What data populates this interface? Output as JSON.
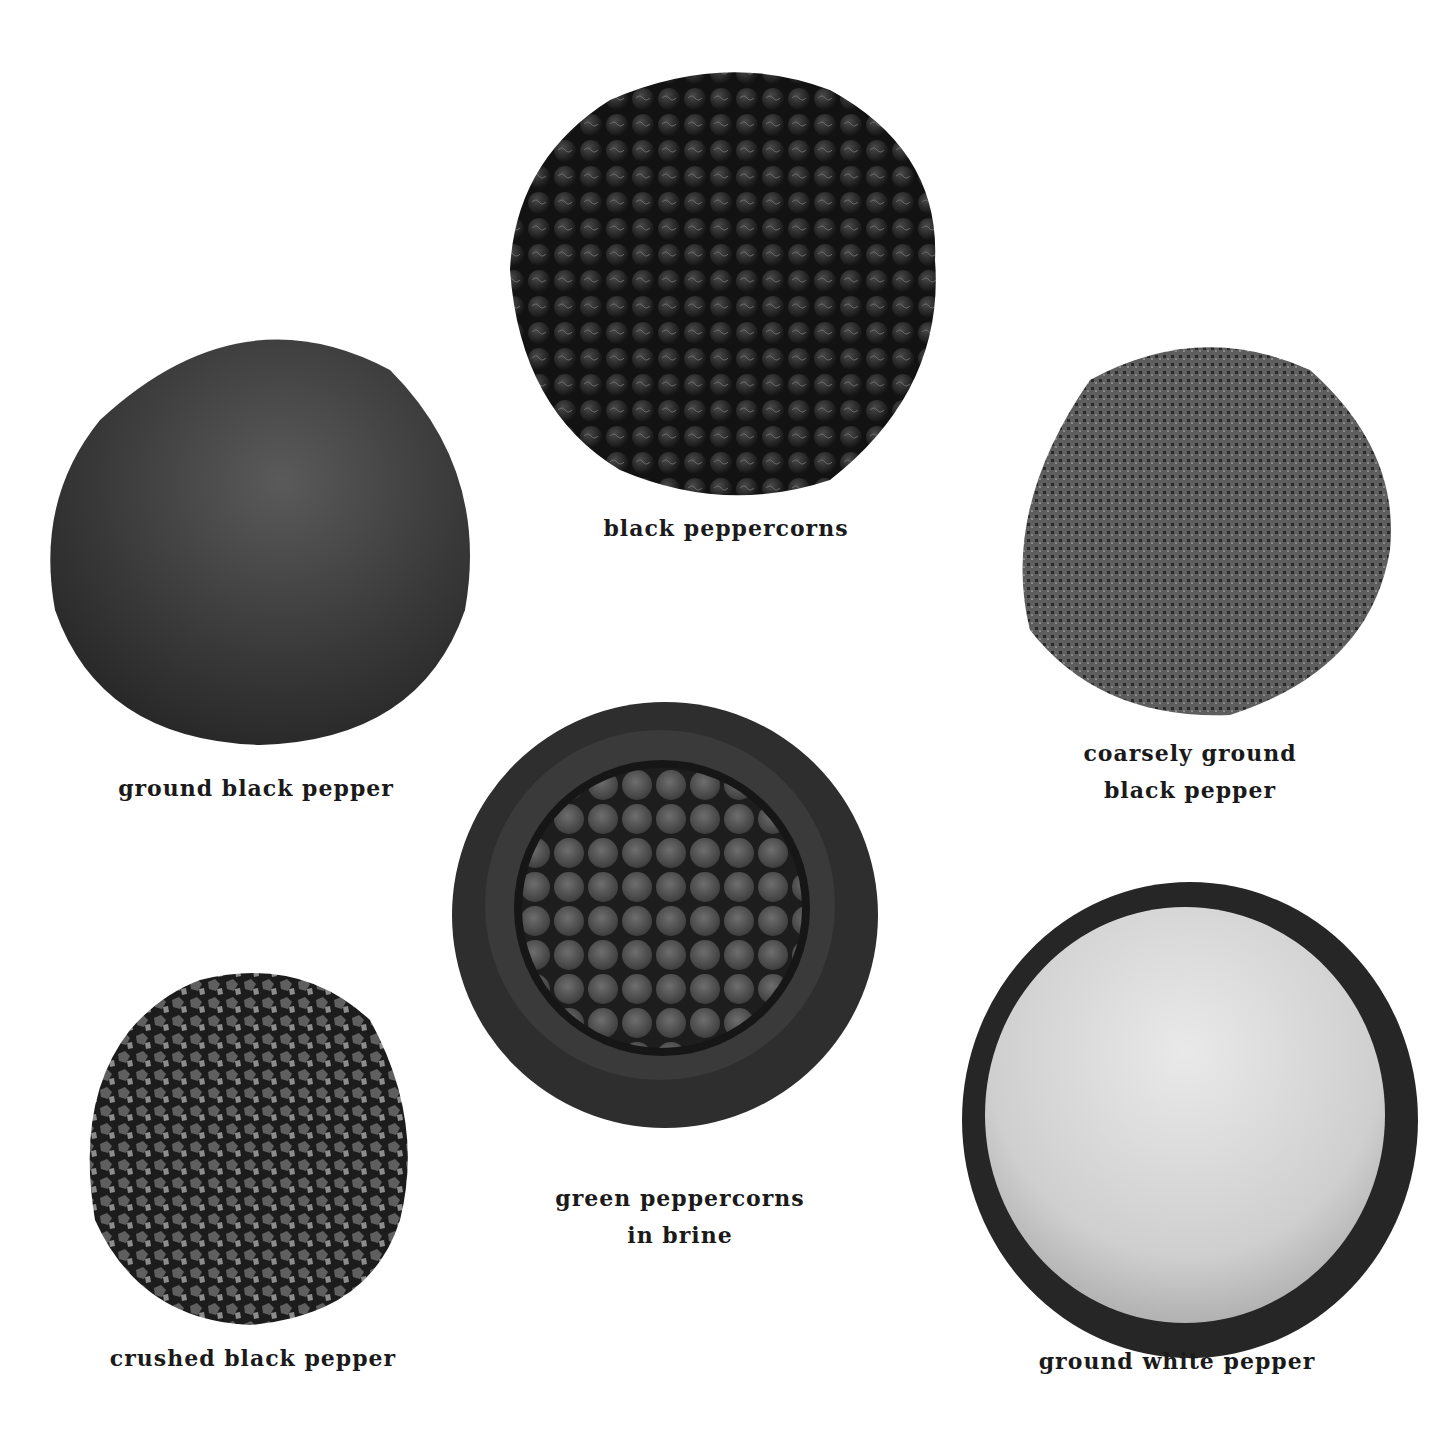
{
  "page": {
    "background": "#ffffff"
  },
  "items": [
    {
      "id": "black-peppercorns",
      "label_line1": "black peppercorns",
      "label_line2": ""
    },
    {
      "id": "coarsely-ground",
      "label_line1": "coarsely ground",
      "label_line2": "black pepper"
    },
    {
      "id": "ground-black",
      "label_line1": "ground black pepper",
      "label_line2": ""
    },
    {
      "id": "green-peppercorns",
      "label_line1": "green peppercorns",
      "label_line2": "in brine"
    },
    {
      "id": "crushed-black",
      "label_line1": "crushed black pepper",
      "label_line2": ""
    },
    {
      "id": "ground-white",
      "label_line1": "ground white pepper",
      "label_line2": ""
    }
  ],
  "colors": {
    "peppercorn": "#1b1b1b",
    "peppercorn_highlight": "#4a4a4a",
    "ground_black": "#3c3c3c",
    "coarse": "#5a5a5a",
    "bowl": "#2c2c2c",
    "bowl_rim": "#3e3e3e",
    "green_berry": "#5d5d5d",
    "white_pepper": "#d8d8d8",
    "label": "#1a1a1a"
  }
}
